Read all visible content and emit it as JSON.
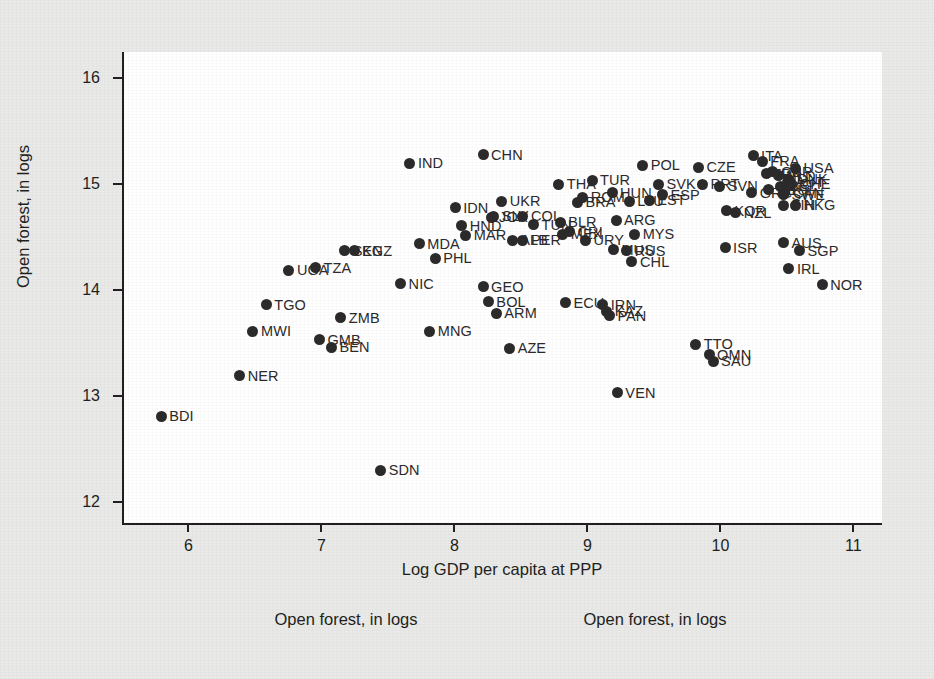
{
  "chart_data": {
    "type": "scatter",
    "title": "",
    "xlabel": "Log GDP per capita at PPP",
    "ylabel": "Open forest, in logs",
    "xlim": [
      5.5,
      11.2
    ],
    "ylim": [
      11.8,
      16.25
    ],
    "xticks": [
      6,
      7,
      8,
      9,
      10,
      11
    ],
    "yticks": [
      12,
      13,
      14,
      15,
      16
    ],
    "xtick_labels": [
      "6",
      "7",
      "8",
      "9",
      "10",
      "11"
    ],
    "ytick_labels": [
      "12",
      "13",
      "14",
      "15",
      "16"
    ],
    "grid": false,
    "legend": "none",
    "marker_color": "#2c2a2b",
    "point_label_position": "right",
    "points": [
      {
        "label": "BDI",
        "x": 5.78,
        "y": 12.81
      },
      {
        "label": "NER",
        "x": 6.37,
        "y": 13.19
      },
      {
        "label": "MWI",
        "x": 6.47,
        "y": 13.61
      },
      {
        "label": "TGO",
        "x": 6.57,
        "y": 13.86
      },
      {
        "label": "UGA",
        "x": 6.74,
        "y": 14.19
      },
      {
        "label": "TZA",
        "x": 6.94,
        "y": 14.21
      },
      {
        "label": "GMB",
        "x": 6.97,
        "y": 13.53
      },
      {
        "label": "BEN",
        "x": 7.06,
        "y": 13.46
      },
      {
        "label": "ZMB",
        "x": 7.13,
        "y": 13.74
      },
      {
        "label": "SEN",
        "x": 7.16,
        "y": 14.37
      },
      {
        "label": "KGZ",
        "x": 7.23,
        "y": 14.37
      },
      {
        "label": "SDN",
        "x": 7.43,
        "y": 12.3
      },
      {
        "label": "NIC",
        "x": 7.58,
        "y": 14.06
      },
      {
        "label": "IND",
        "x": 7.65,
        "y": 15.2
      },
      {
        "label": "MDA",
        "x": 7.72,
        "y": 14.44
      },
      {
        "label": "MNG",
        "x": 7.8,
        "y": 13.61
      },
      {
        "label": "PHL",
        "x": 7.84,
        "y": 14.3
      },
      {
        "label": "IDN",
        "x": 7.99,
        "y": 14.78
      },
      {
        "label": "HND",
        "x": 8.04,
        "y": 14.61
      },
      {
        "label": "MAR",
        "x": 8.07,
        "y": 14.52
      },
      {
        "label": "GEO",
        "x": 8.2,
        "y": 14.03
      },
      {
        "label": "CHN",
        "x": 8.2,
        "y": 15.28
      },
      {
        "label": "BOL",
        "x": 8.24,
        "y": 13.89
      },
      {
        "label": "JOR",
        "x": 8.26,
        "y": 14.69
      },
      {
        "label": "SLV",
        "x": 8.28,
        "y": 14.7
      },
      {
        "label": "ARM",
        "x": 8.3,
        "y": 13.78
      },
      {
        "label": "UKR",
        "x": 8.34,
        "y": 14.84
      },
      {
        "label": "AZE",
        "x": 8.4,
        "y": 13.45
      },
      {
        "label": "ALB",
        "x": 8.42,
        "y": 14.47
      },
      {
        "label": "PER",
        "x": 8.5,
        "y": 14.47
      },
      {
        "label": "COL",
        "x": 8.5,
        "y": 14.7
      },
      {
        "label": "TUN",
        "x": 8.58,
        "y": 14.62
      },
      {
        "label": "THA",
        "x": 8.77,
        "y": 15.0
      },
      {
        "label": "BLR",
        "x": 8.78,
        "y": 14.64
      },
      {
        "label": "MEX",
        "x": 8.8,
        "y": 14.53
      },
      {
        "label": "CRI",
        "x": 8.85,
        "y": 14.55
      },
      {
        "label": "ECU",
        "x": 8.82,
        "y": 13.88
      },
      {
        "label": "BRA",
        "x": 8.91,
        "y": 14.83
      },
      {
        "label": "ROM",
        "x": 8.95,
        "y": 14.88
      },
      {
        "label": "URY",
        "x": 8.97,
        "y": 14.47
      },
      {
        "label": "TUR",
        "x": 9.02,
        "y": 15.04
      },
      {
        "label": "IRN",
        "x": 9.1,
        "y": 13.86
      },
      {
        "label": "KAZ",
        "x": 9.13,
        "y": 13.8
      },
      {
        "label": "PAN",
        "x": 9.15,
        "y": 13.76
      },
      {
        "label": "HUN",
        "x": 9.17,
        "y": 14.92
      },
      {
        "label": "ARG",
        "x": 9.2,
        "y": 14.66
      },
      {
        "label": "MUS",
        "x": 9.18,
        "y": 14.38
      },
      {
        "label": "VEN",
        "x": 9.21,
        "y": 13.03
      },
      {
        "label": "RUS",
        "x": 9.28,
        "y": 14.37
      },
      {
        "label": "LTU",
        "x": 9.3,
        "y": 14.84
      },
      {
        "label": "CHL",
        "x": 9.32,
        "y": 14.27
      },
      {
        "label": "MYS",
        "x": 9.34,
        "y": 14.53
      },
      {
        "label": "POL",
        "x": 9.4,
        "y": 15.18
      },
      {
        "label": "EST",
        "x": 9.45,
        "y": 14.85
      },
      {
        "label": "SVK",
        "x": 9.52,
        "y": 15.0
      },
      {
        "label": "ESP",
        "x": 9.55,
        "y": 14.9
      },
      {
        "label": "TTO",
        "x": 9.8,
        "y": 13.49
      },
      {
        "label": "CZE",
        "x": 9.82,
        "y": 15.16
      },
      {
        "label": "PRT",
        "x": 9.85,
        "y": 15.0
      },
      {
        "label": "OMN",
        "x": 9.9,
        "y": 13.39
      },
      {
        "label": "SAU",
        "x": 9.93,
        "y": 13.33
      },
      {
        "label": "SVN",
        "x": 9.98,
        "y": 14.98
      },
      {
        "label": "ISR",
        "x": 10.02,
        "y": 14.4
      },
      {
        "label": "KOR",
        "x": 10.03,
        "y": 14.75
      },
      {
        "label": "NZL",
        "x": 10.1,
        "y": 14.73
      },
      {
        "label": "ITA",
        "x": 10.23,
        "y": 15.27
      },
      {
        "label": "GRC",
        "x": 10.22,
        "y": 14.92
      },
      {
        "label": "FRA",
        "x": 10.3,
        "y": 15.22
      },
      {
        "label": "JPN",
        "x": 10.33,
        "y": 15.1
      },
      {
        "label": "DEU",
        "x": 10.35,
        "y": 14.95
      },
      {
        "label": "GBR",
        "x": 10.38,
        "y": 15.12
      },
      {
        "label": "NLD",
        "x": 10.42,
        "y": 15.08
      },
      {
        "label": "BEL",
        "x": 10.44,
        "y": 14.98
      },
      {
        "label": "SWE",
        "x": 10.46,
        "y": 14.9
      },
      {
        "label": "CAN",
        "x": 10.47,
        "y": 14.92
      },
      {
        "label": "AUT",
        "x": 10.49,
        "y": 15.02
      },
      {
        "label": "DNK",
        "x": 10.5,
        "y": 15.05
      },
      {
        "label": "CHE",
        "x": 10.52,
        "y": 15.0
      },
      {
        "label": "FIN",
        "x": 10.46,
        "y": 14.8
      },
      {
        "label": "HKG",
        "x": 10.55,
        "y": 14.8
      },
      {
        "label": "USA",
        "x": 10.55,
        "y": 15.15
      },
      {
        "label": "AUS",
        "x": 10.46,
        "y": 14.45
      },
      {
        "label": "SGP",
        "x": 10.58,
        "y": 14.37
      },
      {
        "label": "IRL",
        "x": 10.5,
        "y": 14.2
      },
      {
        "label": "NOR",
        "x": 10.75,
        "y": 14.05
      }
    ]
  },
  "captions": {
    "left": "Open forest, in logs",
    "right": "Open forest, in logs"
  }
}
